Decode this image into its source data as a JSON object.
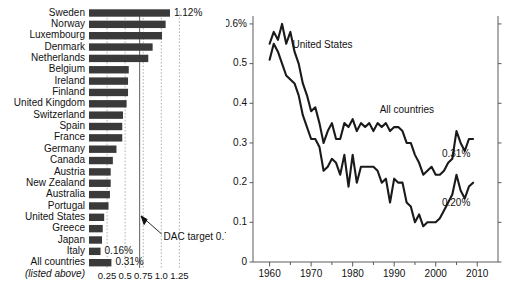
{
  "chart_data": [
    {
      "type": "bar",
      "title": "",
      "orientation": "horizontal",
      "xlabel": "",
      "ylabel": "",
      "xlim": [
        0,
        1.35
      ],
      "grid": true,
      "tick_labels": [
        "0.25",
        "0.5",
        "0.75",
        "1.0",
        "1.25"
      ],
      "tick_values": [
        0.25,
        0.5,
        0.75,
        1.0,
        1.25
      ],
      "categories": [
        "Sweden",
        "Norway",
        "Luxembourg",
        "Denmark",
        "Netherlands",
        "Belgium",
        "Ireland",
        "Finland",
        "United Kingdom",
        "Switzerland",
        "Spain",
        "France",
        "Germany",
        "Canada",
        "Austria",
        "New Zealand",
        "Australia",
        "Portugal",
        "United States",
        "Greece",
        "Japan",
        "Italy",
        "All countries"
      ],
      "values": [
        1.12,
        1.06,
        1.01,
        0.88,
        0.82,
        0.55,
        0.54,
        0.54,
        0.52,
        0.47,
        0.46,
        0.46,
        0.38,
        0.33,
        0.3,
        0.3,
        0.29,
        0.27,
        0.21,
        0.19,
        0.18,
        0.16,
        0.31
      ],
      "value_labels": [
        {
          "category": "Sweden",
          "text": "1.12%"
        },
        {
          "category": "Italy",
          "text": "0.16%"
        },
        {
          "category": "All countries",
          "text": "0.31%"
        }
      ],
      "sub_caption": "(listed above)",
      "annotation": {
        "text": "DAC target 0.7%",
        "value": 0.7
      }
    },
    {
      "type": "line",
      "title": "",
      "xlabel": "",
      "ylabel": "",
      "xlim": [
        1956,
        2015
      ],
      "ylim": [
        0,
        0.62
      ],
      "grid": false,
      "x_tick_values": [
        1960,
        1970,
        1980,
        1990,
        2000,
        2010
      ],
      "x_tick_labels": [
        "1960",
        "1970",
        "1980",
        "1990",
        "2000",
        "2010"
      ],
      "y_tick_values": [
        0,
        0.1,
        0.2,
        0.3,
        0.4,
        0.5,
        0.6
      ],
      "y_tick_labels": [
        "0",
        "0.1",
        "0.2",
        "0.3",
        "0.4",
        "0.5",
        "0.6%"
      ],
      "series": [
        {
          "name": "United States",
          "label": "United States",
          "end_label": "0.20%",
          "x": [
            1960,
            1961,
            1962,
            1963,
            1964,
            1965,
            1966,
            1967,
            1968,
            1969,
            1970,
            1971,
            1972,
            1973,
            1974,
            1975,
            1976,
            1977,
            1978,
            1979,
            1980,
            1981,
            1982,
            1983,
            1984,
            1985,
            1986,
            1987,
            1988,
            1989,
            1990,
            1991,
            1992,
            1993,
            1994,
            1995,
            1996,
            1997,
            1998,
            1999,
            2000,
            2001,
            2002,
            2003,
            2004,
            2005,
            2006,
            2007,
            2008,
            2009
          ],
          "values": [
            0.51,
            0.55,
            0.53,
            0.5,
            0.47,
            0.46,
            0.45,
            0.42,
            0.37,
            0.34,
            0.31,
            0.31,
            0.29,
            0.23,
            0.24,
            0.26,
            0.25,
            0.22,
            0.27,
            0.19,
            0.27,
            0.2,
            0.24,
            0.24,
            0.24,
            0.24,
            0.23,
            0.2,
            0.21,
            0.15,
            0.21,
            0.2,
            0.2,
            0.15,
            0.14,
            0.1,
            0.12,
            0.09,
            0.1,
            0.1,
            0.1,
            0.11,
            0.13,
            0.15,
            0.17,
            0.22,
            0.18,
            0.16,
            0.19,
            0.2
          ]
        },
        {
          "name": "All countries",
          "label": "All countries",
          "end_label": "0.31%",
          "x": [
            1960,
            1961,
            1962,
            1963,
            1964,
            1965,
            1966,
            1967,
            1968,
            1969,
            1970,
            1971,
            1972,
            1973,
            1974,
            1975,
            1976,
            1977,
            1978,
            1979,
            1980,
            1981,
            1982,
            1983,
            1984,
            1985,
            1986,
            1987,
            1988,
            1989,
            1990,
            1991,
            1992,
            1993,
            1994,
            1995,
            1996,
            1997,
            1998,
            1999,
            2000,
            2001,
            2002,
            2003,
            2004,
            2005,
            2006,
            2007,
            2008,
            2009
          ],
          "values": [
            0.55,
            0.58,
            0.56,
            0.6,
            0.55,
            0.58,
            0.53,
            0.5,
            0.45,
            0.42,
            0.38,
            0.39,
            0.35,
            0.3,
            0.33,
            0.35,
            0.31,
            0.31,
            0.35,
            0.34,
            0.36,
            0.33,
            0.35,
            0.34,
            0.35,
            0.33,
            0.35,
            0.34,
            0.35,
            0.33,
            0.34,
            0.34,
            0.33,
            0.3,
            0.3,
            0.27,
            0.25,
            0.22,
            0.23,
            0.24,
            0.22,
            0.22,
            0.23,
            0.25,
            0.26,
            0.33,
            0.3,
            0.28,
            0.31,
            0.31
          ]
        }
      ]
    }
  ]
}
